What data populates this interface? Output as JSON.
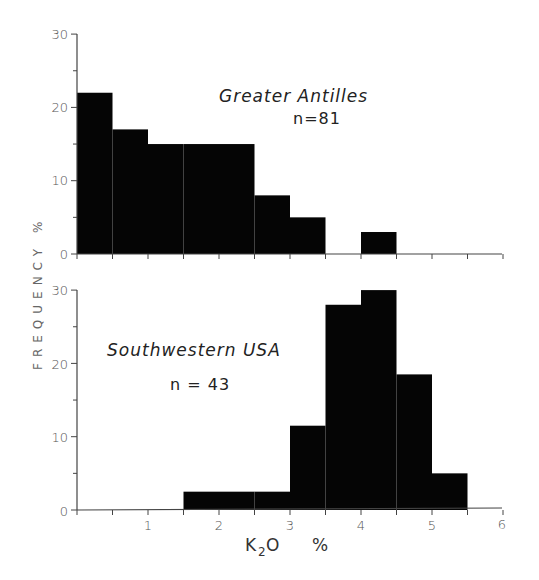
{
  "chart_data": [
    {
      "type": "bar",
      "title": "Greater Antilles",
      "annotation": "n=81",
      "xlabel": "K2O %",
      "ylabel": "FREQUENCY %",
      "bin_edges": [
        0,
        0.5,
        1,
        1.5,
        2,
        2.5,
        3,
        3.5,
        4,
        4.5,
        5,
        5.5,
        6
      ],
      "categories": [
        "0-0.5",
        "0.5-1",
        "1-1.5",
        "1.5-2",
        "2-2.5",
        "2.5-3",
        "3-3.5",
        "3.5-4",
        "4-4.5",
        "4.5-5",
        "5-5.5",
        "5.5-6"
      ],
      "values": [
        22,
        17,
        15,
        15,
        15,
        8,
        5,
        0,
        3,
        0,
        0,
        0
      ],
      "ylim": [
        0,
        30
      ],
      "yticks": [
        0,
        10,
        20,
        30
      ],
      "xlim": [
        0,
        6
      ],
      "grid": false
    },
    {
      "type": "bar",
      "title": "Southwestern USA",
      "annotation": "n = 43",
      "xlabel": "K2O %",
      "ylabel": "FREQUENCY %",
      "bin_edges": [
        0,
        0.5,
        1,
        1.5,
        2,
        2.5,
        3,
        3.5,
        4,
        4.5,
        5,
        5.5,
        6
      ],
      "categories": [
        "0-0.5",
        "0.5-1",
        "1-1.5",
        "1.5-2",
        "2-2.5",
        "2.5-3",
        "3-3.5",
        "3.5-4",
        "4-4.5",
        "4.5-5",
        "5-5.5",
        "5.5-6"
      ],
      "values": [
        0,
        0,
        0,
        2.5,
        2.5,
        2.5,
        11.5,
        28,
        30,
        18.5,
        5,
        0
      ],
      "ylim": [
        0,
        30
      ],
      "yticks": [
        0,
        10,
        20,
        30
      ],
      "xticks": [
        1,
        2,
        3,
        4,
        5,
        6
      ],
      "xlim": [
        0,
        6
      ],
      "grid": false
    }
  ],
  "labels": {
    "top_title": "Greater Antilles",
    "top_n": "n=81",
    "bottom_title": "Southwestern USA",
    "bottom_n": "n = 43",
    "y_axis": "FREQUENCY   %",
    "x_axis_main": "K",
    "x_axis_sub": "2",
    "x_axis_tail": "O",
    "x_axis_unit": "%",
    "ytick_0": "0",
    "ytick_10": "10",
    "ytick_20": "20",
    "ytick_30": "30",
    "xtick_1": "1",
    "xtick_2": "2",
    "xtick_3": "3",
    "xtick_4": "4",
    "xtick_5": "5",
    "xtick_6": "6"
  },
  "colors": {
    "bar": "#050505",
    "axis": "#444444"
  }
}
